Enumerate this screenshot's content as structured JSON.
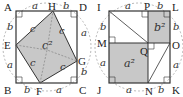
{
  "colors": {
    "stroke": "#333333",
    "shade": "#c8c8c8",
    "dashed": "#888888",
    "background": "#ffffff"
  },
  "left_figure": {
    "vertices": {
      "A": "A",
      "B": "B",
      "C": "C",
      "D": "D"
    },
    "side_points": {
      "E": "E",
      "F": "F",
      "G": "G",
      "H": "H"
    },
    "segment_labels": {
      "AH": "a",
      "HD": "b",
      "DG": "a",
      "GC": "b",
      "CF": "a",
      "FB": "b",
      "BE": "a",
      "EA": "b"
    },
    "inner_side_label": "c",
    "area_label": "c²"
  },
  "right_figure": {
    "vertices": {
      "I": "I",
      "J": "J",
      "K": "K",
      "L": "L"
    },
    "side_points": {
      "P": "P",
      "M": "M",
      "O": "O",
      "N": "N",
      "Q": "Q"
    },
    "segment_labels": {
      "IP": "a",
      "PL": "b",
      "LO": "b",
      "OK": "a",
      "KN": "b",
      "NJ": "a",
      "JM": "a",
      "MI": "b"
    },
    "area_label_small": "b²",
    "area_label_large": "a²"
  }
}
